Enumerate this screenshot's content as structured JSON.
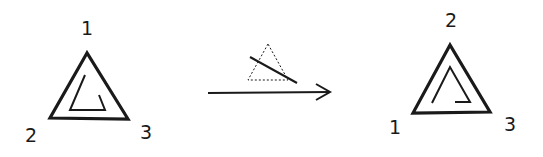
{
  "diagram": {
    "stroke_color": "#1a1a1a",
    "before": {
      "vertex_labels": {
        "top": "1",
        "bottom_left": "2",
        "bottom_right": "3"
      }
    },
    "transform": {
      "type": "reflection",
      "icon": "dotted-triangle-with-mirror-line",
      "arrow": "right-arrow"
    },
    "after": {
      "vertex_labels": {
        "top": "2",
        "bottom_left": "1",
        "bottom_right": "3"
      }
    }
  }
}
